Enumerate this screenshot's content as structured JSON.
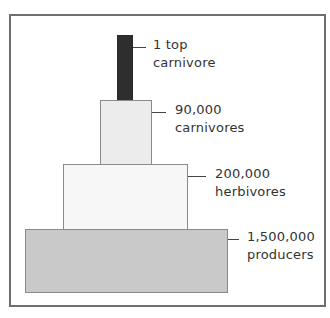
{
  "diagram": {
    "type": "pyramid-of-numbers",
    "levels": [
      {
        "id": "top-carnivore",
        "count": "1 top",
        "group": "carnivore",
        "fill": "#2e2e2e"
      },
      {
        "id": "carnivores",
        "count": "90,000",
        "group": "carnivores",
        "fill": "#ececec"
      },
      {
        "id": "herbivores",
        "count": "200,000",
        "group": "herbivores",
        "fill": "#f7f7f7"
      },
      {
        "id": "producers",
        "count": "1,500,000",
        "group": "producers",
        "fill": "#c9c9c9"
      }
    ],
    "colors": {
      "frame_border": "#6e6e6e",
      "block_border": "#8a8a8a",
      "text": "#333333"
    }
  }
}
